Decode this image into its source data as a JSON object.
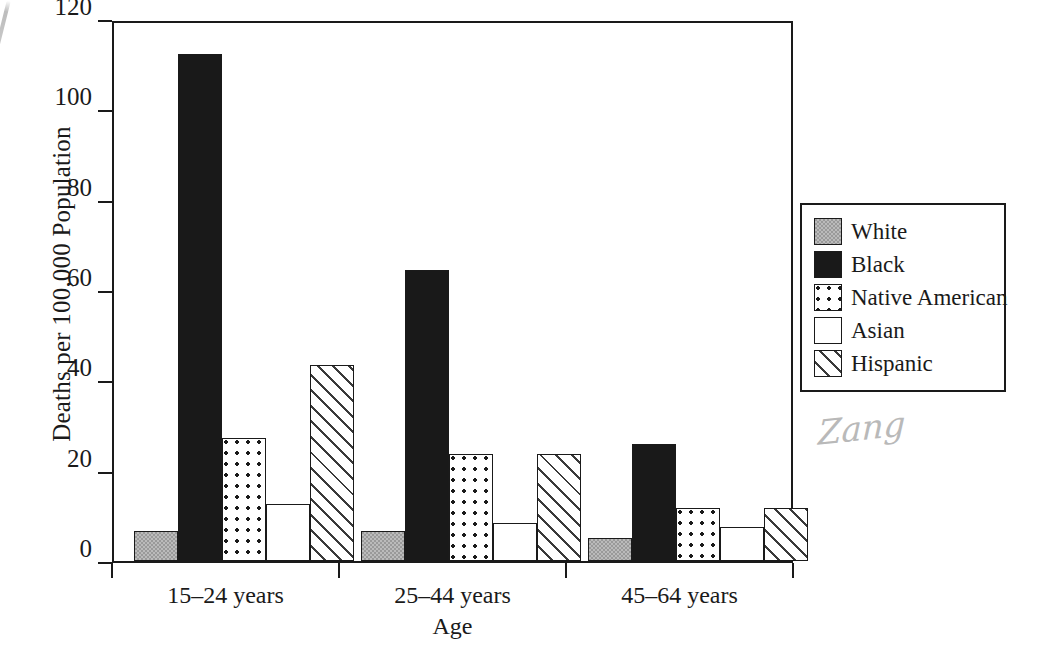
{
  "chart_data": {
    "type": "bar",
    "title": "",
    "xlabel": "Age",
    "ylabel": "Deaths per 100,000 Population",
    "categories": [
      "15–24 years",
      "25–44 years",
      "45–64 years"
    ],
    "series": [
      {
        "name": "White",
        "pattern": "gray-checker",
        "values": [
          6.6,
          6.6,
          5.1
        ]
      },
      {
        "name": "Black",
        "pattern": "solid-black",
        "values": [
          112.3,
          64.5,
          26.0
        ]
      },
      {
        "name": "Native American",
        "pattern": "dotted",
        "values": [
          27.3,
          23.6,
          11.8
        ]
      },
      {
        "name": "Asian",
        "pattern": "empty-white",
        "values": [
          12.7,
          8.5,
          7.6
        ]
      },
      {
        "name": "Hispanic",
        "pattern": "diagonal-hatch",
        "values": [
          43.3,
          23.6,
          11.8
        ]
      }
    ],
    "ylim": [
      0,
      120
    ],
    "yticks": [
      0,
      20,
      40,
      60,
      80,
      100,
      120
    ],
    "ytick_labels": [
      "0",
      "20",
      "40",
      "60",
      "80",
      "100",
      "120"
    ],
    "grid": false,
    "legend_position": "right"
  },
  "legend": {
    "items": [
      {
        "label": "White"
      },
      {
        "label": "Black"
      },
      {
        "label": "Native American"
      },
      {
        "label": "Asian"
      },
      {
        "label": "Hispanic"
      }
    ]
  },
  "annotations": {
    "signature": "Zang"
  }
}
